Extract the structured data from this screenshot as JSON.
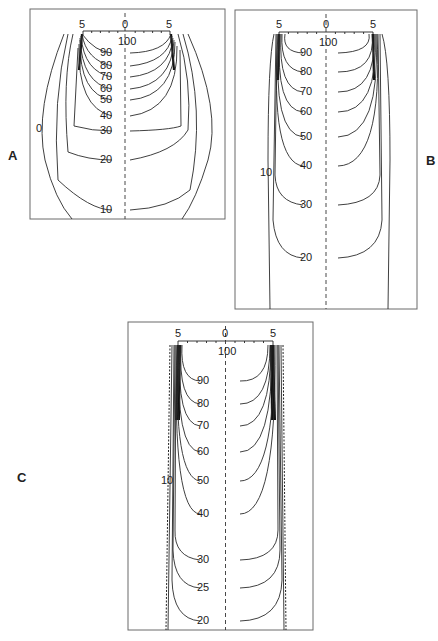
{
  "panels": [
    {
      "id": "A",
      "label": "A",
      "axis": {
        "left": "5",
        "center": "0",
        "right": "5"
      },
      "center_value": "100",
      "contours": [
        "90",
        "80",
        "70",
        "60",
        "50",
        "40",
        "30",
        "20",
        "10"
      ],
      "side_label": "0"
    },
    {
      "id": "B",
      "label": "B",
      "axis": {
        "left": "5",
        "center": "0",
        "right": "5"
      },
      "center_value": "100",
      "contours": [
        "90",
        "80",
        "70",
        "60",
        "50",
        "40",
        "30",
        "20"
      ],
      "side_label": "10"
    },
    {
      "id": "C",
      "label": "C",
      "axis": {
        "left": "5",
        "center": "0",
        "right": "5"
      },
      "center_value": "100",
      "contours": [
        "90",
        "80",
        "70",
        "60",
        "50",
        "40",
        "30",
        "25",
        "20"
      ],
      "side_label": "10"
    }
  ]
}
